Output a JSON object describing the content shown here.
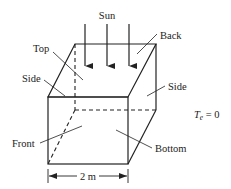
{
  "diagram": {
    "type": "box-solar-heating",
    "labels": {
      "sun": "Sun",
      "top": "Top",
      "back": "Back",
      "side_left": "Side",
      "side_right": "Side",
      "front": "Front",
      "bottom": "Bottom",
      "dimension": "2 m",
      "env_temp_symbol": "T",
      "env_temp_sub": "e",
      "env_temp_value": " = 0"
    },
    "sun_rays": 3,
    "colors": {
      "line": "#222222",
      "background": "#ffffff"
    }
  }
}
